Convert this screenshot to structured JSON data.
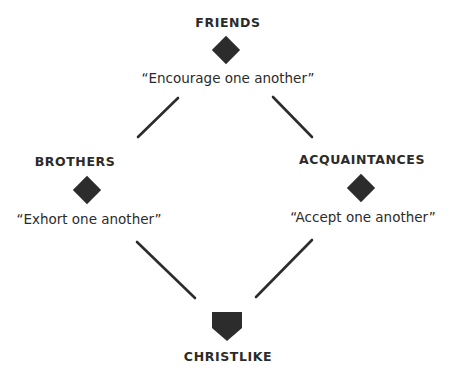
{
  "diagram": {
    "nodes": [
      {
        "id": "friends",
        "label": "FRIENDS",
        "quote": "“Encourage one another”",
        "shape": "diamond"
      },
      {
        "id": "brothers",
        "label": "BROTHERS",
        "quote": "“Exhort one another”",
        "shape": "diamond"
      },
      {
        "id": "acquaintances",
        "label": "ACQUAINTANCES",
        "quote": "“Accept one another”",
        "shape": "diamond"
      },
      {
        "id": "christlike",
        "label": "CHRISTLIKE",
        "shape": "shield"
      }
    ],
    "edges": [
      {
        "from": "friends",
        "to": "brothers"
      },
      {
        "from": "friends",
        "to": "acquaintances"
      },
      {
        "from": "brothers",
        "to": "christlike"
      },
      {
        "from": "acquaintances",
        "to": "christlike"
      }
    ],
    "colors": {
      "ink": "#2c2c2c",
      "background": "#ffffff"
    }
  }
}
